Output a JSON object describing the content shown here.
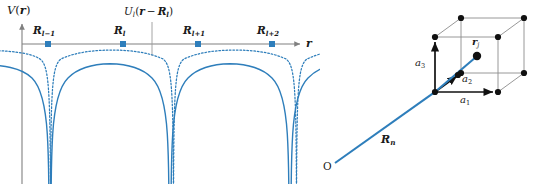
{
  "figure": {
    "background_color": "#ffffff",
    "accent_color": "#2e7ebb",
    "ink_color": "#1a1a1a",
    "axis_color": "#808080"
  },
  "left_panel": {
    "name": "periodic-potential-plot",
    "axis": {
      "y_label": "V(r)",
      "y_label_parts": {
        "func": "V",
        "open": "(",
        "var": "r",
        "close": ")"
      },
      "x_label": "r",
      "x_axis_color": "#808080",
      "y_axis_color": "#808080"
    },
    "envelope_label": {
      "text": "U_l(r − R_l)",
      "parts": {
        "func": "U",
        "sub": "l",
        "open": "(",
        "var1": "r",
        "minus": "−",
        "var2": "R",
        "var2_sub": "l",
        "close": ")"
      }
    },
    "lattice_sites": [
      {
        "id": "site-l-minus-1",
        "label": "R",
        "sub": "l−1",
        "x": 48,
        "y": 44
      },
      {
        "id": "site-l",
        "label": "R",
        "sub": "l",
        "x": 123,
        "y": 44
      },
      {
        "id": "site-l-plus-1",
        "label": "R",
        "sub": "l+1",
        "x": 198,
        "y": 44
      },
      {
        "id": "site-l-plus-2",
        "label": "R",
        "sub": "l+2",
        "x": 272,
        "y": 44
      }
    ],
    "curves": {
      "total_potential": {
        "name": "total-periodic-potential",
        "style": "solid",
        "color": "#2e7ebb"
      },
      "atomic_potential": {
        "name": "single-atomic-potential",
        "style": "dotted",
        "color": "#2e7ebb"
      }
    }
  },
  "right_panel": {
    "name": "lattice-cell-diagram",
    "origin_label": "O",
    "lattice_vector_label": "R",
    "lattice_vector_sub": "n",
    "basis_position_label": "r",
    "basis_position_sub": "j",
    "primitive_vectors": [
      {
        "id": "a1",
        "label": "a",
        "sub": "1"
      },
      {
        "id": "a2",
        "label": "a",
        "sub": "2"
      },
      {
        "id": "a3",
        "label": "a",
        "sub": "3"
      }
    ],
    "cube": {
      "edge_color": "#8c8c8c",
      "vertex_color": "#111111",
      "vertex_count": 8
    }
  }
}
